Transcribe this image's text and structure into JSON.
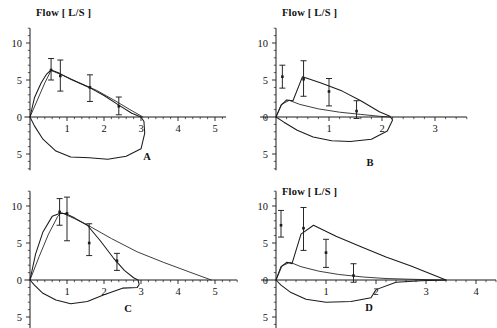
{
  "figure": {
    "width": 497,
    "height": 328,
    "background": "#ffffff",
    "ink_color": "#1b1b1b",
    "panel_count": 4
  },
  "chart_data": [
    {
      "id": "A",
      "type": "line",
      "title": "Flow [ L/S ]",
      "panel_letter": "A",
      "xlabel": "",
      "ylabel": "Flow [ L/S ]",
      "xlim": [
        -0.15,
        5.3
      ],
      "ylim": [
        -7.2,
        12.0
      ],
      "xticks": [
        1,
        2,
        3,
        4,
        5
      ],
      "xtick_labels": [
        "1",
        "2",
        "3",
        "4",
        "5"
      ],
      "yticks": [
        0,
        5,
        10,
        -5
      ],
      "ytick_labels": [
        "0",
        "5",
        "10",
        "5"
      ],
      "grid": false,
      "legend": "none",
      "series": [
        {
          "name": "measured-mean-loop",
          "style": "solid",
          "x": [
            0.0,
            0.12,
            0.3,
            0.45,
            0.57,
            0.8,
            1.1,
            1.6,
            2.0,
            2.4,
            2.75,
            3.0,
            3.08,
            3.1,
            3.0,
            2.6,
            2.1,
            1.6,
            1.1,
            0.7,
            0.35,
            0.12,
            0.0
          ],
          "y": [
            0.0,
            2.6,
            4.6,
            5.8,
            6.35,
            5.9,
            5.1,
            4.0,
            2.9,
            1.6,
            0.5,
            0.0,
            -0.6,
            -2.2,
            -4.3,
            -5.3,
            -5.7,
            -5.5,
            -5.4,
            -4.6,
            -3.0,
            -1.2,
            0.0
          ]
        },
        {
          "name": "model-fit",
          "style": "solid",
          "x": [
            0.0,
            0.2,
            0.4,
            0.57,
            0.9,
            1.3,
            1.8,
            2.3,
            2.7,
            3.0,
            3.05
          ],
          "y": [
            0.0,
            2.3,
            4.6,
            6.3,
            5.6,
            4.7,
            3.6,
            2.2,
            1.0,
            0.15,
            0.0
          ]
        }
      ],
      "error_bars": [
        {
          "x": 0.57,
          "y": 6.35,
          "low": 5.0,
          "high": 7.9
        },
        {
          "x": 0.82,
          "y": 5.55,
          "low": 3.5,
          "high": 7.7
        },
        {
          "x": 1.62,
          "y": 4.0,
          "low": 2.1,
          "high": 5.7
        },
        {
          "x": 2.4,
          "y": 1.45,
          "low": 0.3,
          "high": 2.7
        }
      ]
    },
    {
      "id": "B",
      "type": "line",
      "title": "Flow [ L/S ]",
      "panel_letter": "B",
      "xlabel": "",
      "ylabel": "Flow [ L/S ]",
      "xlim": [
        -0.3,
        3.6
      ],
      "ylim": [
        -7.2,
        12.0
      ],
      "xticks": [
        1,
        2,
        3
      ],
      "xtick_labels": [
        "1",
        "2",
        "3"
      ],
      "yticks": [
        0,
        5,
        10,
        -5
      ],
      "ytick_labels": [
        "0",
        "5",
        "10",
        "5"
      ],
      "grid": false,
      "legend": "none",
      "series": [
        {
          "name": "measured-mean-loop",
          "style": "solid",
          "x": [
            0.0,
            0.1,
            0.2,
            0.32,
            0.5,
            0.85,
            1.25,
            1.6,
            1.95,
            2.15,
            2.2,
            2.1,
            1.8,
            1.4,
            1.05,
            0.7,
            0.4,
            0.15,
            0.0
          ],
          "y": [
            0.0,
            1.6,
            2.3,
            2.2,
            5.45,
            4.6,
            3.5,
            2.2,
            0.7,
            0.1,
            -0.4,
            -1.9,
            -3.0,
            -3.3,
            -3.2,
            -2.7,
            -1.8,
            -0.7,
            0.0
          ]
        },
        {
          "name": "model-fit",
          "style": "solid",
          "x": [
            0.0,
            0.1,
            0.25,
            0.45,
            0.8,
            1.2,
            1.6,
            1.95,
            2.15
          ],
          "y": [
            0.0,
            1.7,
            2.25,
            1.7,
            1.1,
            0.65,
            0.35,
            0.1,
            0.0
          ]
        }
      ],
      "error_bars": [
        {
          "x": 0.12,
          "y": 5.45,
          "low": 3.9,
          "high": 7.0
        },
        {
          "x": 0.52,
          "y": 5.1,
          "low": 2.8,
          "high": 7.6
        },
        {
          "x": 1.0,
          "y": 3.45,
          "low": 1.5,
          "high": 5.2
        },
        {
          "x": 1.52,
          "y": 0.8,
          "low": -0.2,
          "high": 2.2
        }
      ]
    },
    {
      "id": "C",
      "type": "line",
      "title": "",
      "panel_letter": "C",
      "xlabel": "",
      "ylabel": "Flow [ L/S ]",
      "xlim": [
        -0.15,
        5.6
      ],
      "ylim": [
        -7.2,
        12.0
      ],
      "xticks": [
        1,
        2,
        3,
        4,
        5
      ],
      "xtick_labels": [
        "1",
        "2",
        "3",
        "4",
        "5"
      ],
      "yticks": [
        0,
        5,
        10,
        -5
      ],
      "ytick_labels": [
        "0",
        "5",
        "10",
        "5"
      ],
      "grid": false,
      "legend": "none",
      "series": [
        {
          "name": "measured-mean-loop",
          "style": "solid",
          "x": [
            0.0,
            0.15,
            0.35,
            0.6,
            0.8,
            0.95,
            1.2,
            1.55,
            1.9,
            2.25,
            2.55,
            2.8,
            2.92,
            2.95,
            2.9,
            2.5,
            2.0,
            1.55,
            1.1,
            0.7,
            0.35,
            0.12,
            0.0
          ],
          "y": [
            0.0,
            3.5,
            6.5,
            8.6,
            9.0,
            9.0,
            8.4,
            7.4,
            5.3,
            3.0,
            1.3,
            0.3,
            0.0,
            -0.6,
            -1.0,
            -1.1,
            -2.0,
            -2.9,
            -3.2,
            -2.7,
            -1.8,
            -0.7,
            0.0
          ]
        },
        {
          "name": "model-fit",
          "style": "solid",
          "x": [
            0.0,
            0.25,
            0.5,
            0.75,
            0.85,
            1.2,
            1.6,
            2.2,
            2.9,
            3.6,
            4.3,
            4.9
          ],
          "y": [
            0.0,
            3.2,
            6.2,
            8.6,
            9.1,
            8.3,
            7.3,
            5.6,
            3.8,
            2.4,
            1.1,
            0.0
          ]
        }
      ],
      "error_bars": [
        {
          "x": 0.8,
          "y": 9.2,
          "low": 7.4,
          "high": 11.0
        },
        {
          "x": 1.0,
          "y": 9.0,
          "low": 5.3,
          "high": 11.2
        },
        {
          "x": 1.6,
          "y": 5.0,
          "low": 3.3,
          "high": 7.6
        },
        {
          "x": 2.35,
          "y": 2.6,
          "low": 1.3,
          "high": 3.6
        }
      ]
    },
    {
      "id": "D",
      "type": "line",
      "title": "Flow [ L/S ]",
      "panel_letter": "D",
      "xlabel": "",
      "ylabel": "Flow [ L/S ]",
      "xlim": [
        -0.3,
        4.4
      ],
      "ylim": [
        -7.2,
        12.0
      ],
      "xticks": [
        1,
        2,
        3,
        4
      ],
      "xtick_labels": [
        "1",
        "2",
        "3",
        "4"
      ],
      "yticks": [
        0,
        5,
        10,
        -5
      ],
      "ytick_labels": [
        "0",
        "5",
        "10",
        "5"
      ],
      "grid": false,
      "legend": "none",
      "series": [
        {
          "name": "measured-mean-loop",
          "style": "solid",
          "x": [
            0.0,
            0.1,
            0.22,
            0.32,
            0.5,
            0.75,
            1.2,
            1.7,
            2.2,
            2.7,
            3.1,
            3.35,
            3.4,
            2.9,
            2.4,
            2.0,
            1.9,
            1.5,
            1.0,
            0.6,
            0.3,
            0.1,
            0.0
          ],
          "y": [
            0.0,
            1.8,
            2.4,
            2.2,
            6.2,
            7.4,
            5.9,
            4.5,
            3.1,
            1.9,
            0.8,
            0.15,
            0.0,
            -0.1,
            -0.3,
            -1.3,
            -2.4,
            -2.9,
            -3.0,
            -2.6,
            -1.7,
            -0.7,
            0.0
          ]
        },
        {
          "name": "model-fit",
          "style": "solid",
          "x": [
            0.0,
            0.12,
            0.28,
            0.5,
            0.85,
            1.25,
            1.75,
            2.2,
            2.7,
            3.2,
            3.4
          ],
          "y": [
            0.0,
            1.9,
            2.4,
            1.8,
            1.2,
            0.75,
            0.4,
            0.2,
            0.1,
            0.02,
            0.0
          ]
        }
      ],
      "error_bars": [
        {
          "x": 0.1,
          "y": 7.4,
          "low": 5.8,
          "high": 9.4
        },
        {
          "x": 0.55,
          "y": 7.0,
          "low": 4.0,
          "high": 9.8
        },
        {
          "x": 1.0,
          "y": 3.7,
          "low": 1.7,
          "high": 5.5
        },
        {
          "x": 1.55,
          "y": 0.6,
          "low": -0.3,
          "high": 2.2
        }
      ]
    }
  ]
}
